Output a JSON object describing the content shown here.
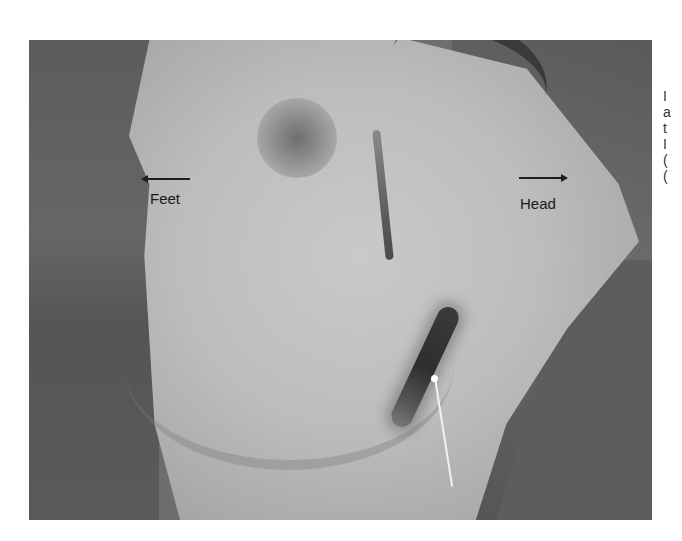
{
  "figure": {
    "labels": {
      "feet": "Feet",
      "head": "Head"
    },
    "orientation_arrows": [
      {
        "label": "Feet",
        "direction": "left"
      },
      {
        "label": "Head",
        "direction": "right"
      }
    ],
    "pointer_arrow": {
      "color": "#ffffff",
      "points_to": "lower wound"
    },
    "clipped_side_text": [
      "I",
      "a",
      "t",
      "I",
      "(",
      "("
    ]
  }
}
